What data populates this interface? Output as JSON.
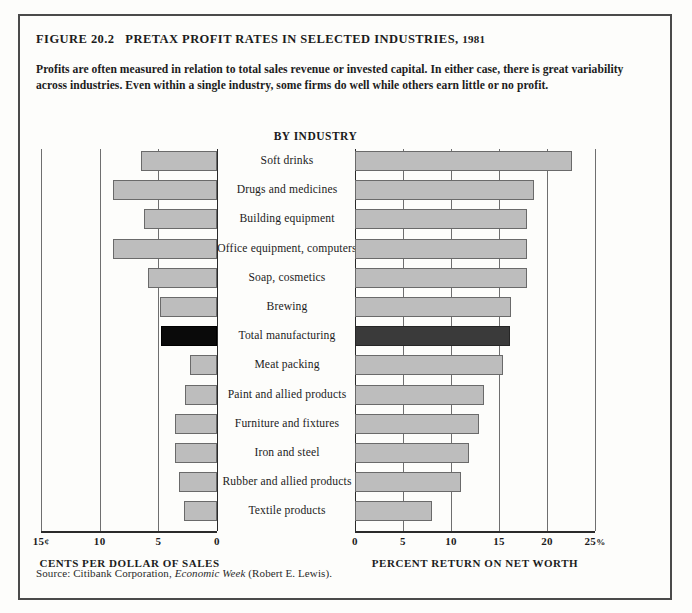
{
  "figure": {
    "label": "FIGURE 20.2",
    "title": "PRETAX PROFIT RATES IN SELECTED INDUSTRIES,",
    "year": "1981",
    "blurb": "Profits are often measured in relation to total sales revenue or invested capital. In either case, there is great variability across industries. Even within a single industry, some firms do well while others earn little or no profit.",
    "column_header": "BY INDUSTRY",
    "source_prefix": "Source: Citibank Corporation,",
    "source_italic": "Economic Week",
    "source_suffix": "(Robert E. Lewis)."
  },
  "chart_data": {
    "type": "bar",
    "title": "PRETAX PROFIT RATES IN SELECTED INDUSTRIES, 1981",
    "orientation": "horizontal",
    "grid": true,
    "legend": "none",
    "highlight_category": "Total manufacturing",
    "highlight_color": "#0a0a0a",
    "bar_color": "#bdbdbd",
    "categories": [
      "Soft drinks",
      "Drugs and medicines",
      "Building equipment",
      "Office equipment, computers",
      "Soap, cosmetics",
      "Brewing",
      "Total manufacturing",
      "Meat packing",
      "Paint and allied products",
      "Furniture and fixtures",
      "Iron and steel",
      "Rubber and allied products",
      "Textile products"
    ],
    "series": [
      {
        "name": "Cents per dollar of sales",
        "panel": "left",
        "direction": "right-to-left",
        "xlabel": "CENTS PER DOLLAR OF SALES",
        "ticks": [
          15,
          10,
          5,
          0
        ],
        "tick_labels": [
          "15¢",
          "10",
          "5",
          "0"
        ],
        "xlim": [
          0,
          15
        ],
        "units": "cents",
        "values": [
          6.5,
          8.9,
          6.2,
          8.9,
          5.9,
          4.9,
          4.8,
          2.3,
          2.7,
          3.6,
          3.6,
          3.2,
          2.8
        ]
      },
      {
        "name": "Percent return on net worth",
        "panel": "right",
        "direction": "left-to-right",
        "xlabel": "PERCENT RETURN ON NET WORTH",
        "ticks": [
          0,
          5,
          10,
          15,
          20,
          25
        ],
        "tick_labels": [
          "0",
          "5",
          "10",
          "15",
          "20",
          "25%"
        ],
        "xlim": [
          0,
          25
        ],
        "units": "percent",
        "values": [
          22.6,
          18.6,
          17.9,
          17.9,
          17.9,
          16.2,
          16.1,
          15.4,
          13.4,
          12.9,
          11.9,
          11.0,
          8.0
        ]
      }
    ]
  }
}
